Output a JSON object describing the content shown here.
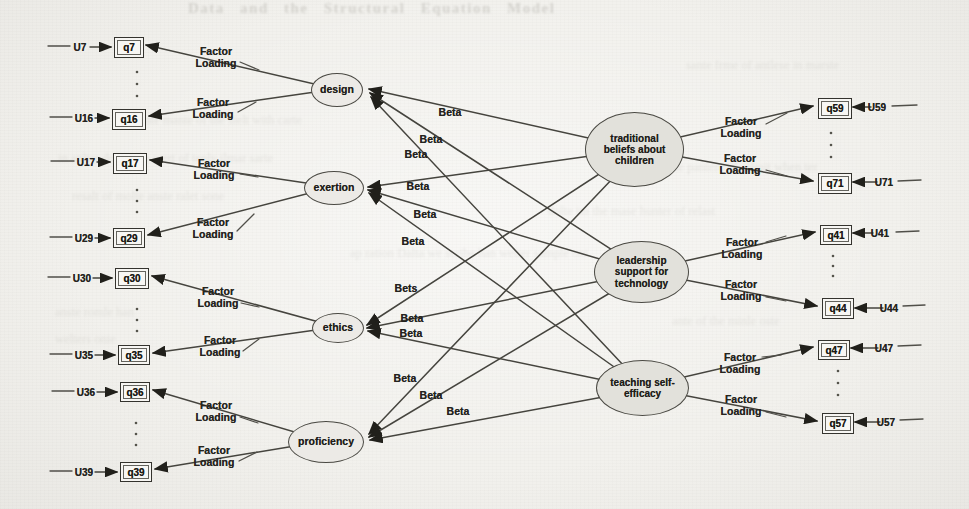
{
  "background": {
    "header_ghost": "Data and the Structural Equation Model",
    "ghost_lines": [
      "onte mante of the sielt with carte",
      "in anlter dosne the wert of tenly ilmar sarte",
      "resalt of molte anste ralet sone",
      "sante frme of antlese in marste",
      "onlte wis the pantere of selmit when ter",
      "dolte im the mase hunter of relast",
      "ap ration Dalta we scribe han wetter sample ont",
      "anste romle han",
      "welters onie",
      "ante of the minle oste"
    ]
  },
  "diagram": {
    "latent_left": [
      {
        "label": "design"
      },
      {
        "label": "exertion"
      },
      {
        "label": "ethics"
      },
      {
        "label": "proficiency"
      }
    ],
    "latent_right": [
      {
        "label": "traditional beliefs about children"
      },
      {
        "label": "leadership support for technology"
      },
      {
        "label": "teaching self-efficacy"
      }
    ],
    "left_indicators": [
      {
        "u": "U7",
        "q": "q7"
      },
      {
        "u": "U16",
        "q": "q16"
      },
      {
        "u": "U17",
        "q": "q17"
      },
      {
        "u": "U29",
        "q": "q29"
      },
      {
        "u": "U30",
        "q": "q30"
      },
      {
        "u": "U35",
        "q": "q35"
      },
      {
        "u": "U36",
        "q": "q36"
      },
      {
        "u": "U39",
        "q": "q39"
      }
    ],
    "right_indicators": [
      {
        "u": "U59",
        "q": "q59"
      },
      {
        "u": "U71",
        "q": "q71"
      },
      {
        "u": "U41",
        "q": "q41"
      },
      {
        "u": "U44",
        "q": "q44"
      },
      {
        "u": "U47",
        "q": "q47"
      },
      {
        "u": "U57",
        "q": "q57"
      }
    ],
    "labels": {
      "factor_line1": "Factor",
      "factor_line2": "Loading"
    },
    "beta_labels": [
      "Beta",
      "Beta",
      "Beta",
      "Beta",
      "Beta",
      "Beta",
      "Bets",
      "Beta",
      "Beta",
      "Beta",
      "Beta",
      "Beta"
    ],
    "measurement": {
      "design": [
        "q7",
        "q16"
      ],
      "exertion": [
        "q17",
        "q29"
      ],
      "ethics": [
        "q30",
        "q35"
      ],
      "proficiency": [
        "q36",
        "q39"
      ],
      "traditional beliefs about children": [
        "q59",
        "q71"
      ],
      "leadership support for technology": [
        "q41",
        "q44"
      ],
      "teaching self-efficacy": [
        "q47",
        "q57"
      ]
    },
    "regressions_note": "Beta paths run from each of the 3 right-side latent variables to each of the 4 left-side latent variables (12 paths)",
    "ellipsis_between_indicator_pairs": true,
    "colors": {
      "paper": "#f2f1ed",
      "ink": "#2b2a26",
      "ellipse_fill_left": "#eceae6",
      "ellipse_fill_right": "#e2e1db",
      "box_fill": "#f7f6f3"
    }
  }
}
